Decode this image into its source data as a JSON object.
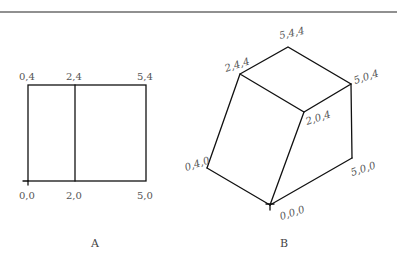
{
  "figure": {
    "top_rule": true,
    "panel_a": {
      "caption": "A",
      "labels": {
        "top_left": "0,4",
        "top_mid": "2,4",
        "top_right": "5,4",
        "bottom_left": "0,0",
        "bottom_mid": "2,0",
        "bottom_right": "5,0"
      },
      "shape": "rectangle split by vertical line at x=2"
    },
    "panel_b": {
      "caption": "B",
      "labels": {
        "v544": "5,4,4",
        "v244": "2,4,4",
        "v504": "5,0,4",
        "v204": "2,0,4",
        "v040": "0,4,0",
        "v500": "5,0,0",
        "v000": "0,0,0"
      },
      "shape": "isometric wedge solid"
    },
    "colors": {
      "line": "#111111",
      "label": "#555555",
      "background": "#ffffff"
    }
  }
}
